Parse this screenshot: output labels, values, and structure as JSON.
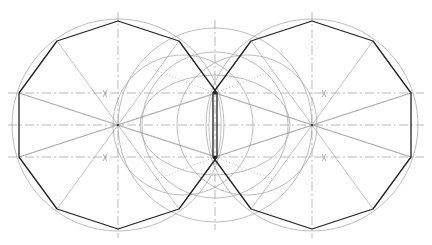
{
  "diagram": {
    "title": "",
    "canvas": {
      "width": 432,
      "height": 245
    },
    "colors": {
      "polygon": "#222222",
      "construction": "#a0a0a0",
      "axis": "#8a8a8a"
    },
    "decagons": [
      {
        "name": "left-decagon",
        "center": [
          118,
          125
        ],
        "radius": 104
      },
      {
        "name": "right-decagon",
        "center": [
          312,
          125
        ],
        "radius": 104
      }
    ],
    "shared_edge": [
      [
        215,
        93
      ],
      [
        215,
        157
      ]
    ],
    "central_circles": [
      {
        "center": [
          215,
          125
        ],
        "radius": 97
      },
      {
        "center": [
          215,
          125
        ],
        "radius": 73
      }
    ],
    "central_ellipse": {
      "center": [
        215,
        125
      ],
      "rx": 75,
      "ry": 50
    },
    "horizontal_axes_y": [
      93,
      125,
      157
    ],
    "vertical_axes_x": [
      118,
      215,
      312
    ]
  }
}
